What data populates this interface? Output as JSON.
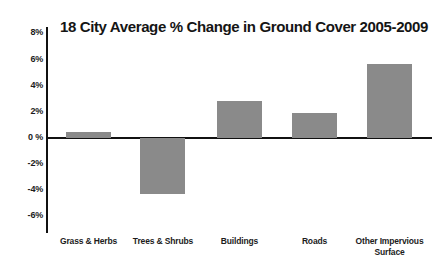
{
  "chart_data": {
    "type": "bar",
    "title": "18 City Average % Change in Ground Cover 2005-2009",
    "xlabel": "",
    "ylabel": "",
    "categories": [
      "Grass & Herbs",
      "Trees & Shrubs",
      "Buildings",
      "Roads",
      "Other Impervious Surface"
    ],
    "values": [
      0.45,
      -4.3,
      2.8,
      1.9,
      5.7
    ],
    "ylim": [
      -6,
      8
    ],
    "ytick_labels": [
      "8%",
      "6%",
      "4%",
      "2%",
      "0 %",
      "-2%",
      "-4%",
      "-6%"
    ],
    "ytick_values": [
      8,
      6,
      4,
      2,
      0,
      -2,
      -4,
      -6
    ],
    "grid": false,
    "legend": false,
    "bar_color": "#8a8a8a",
    "axis_color": "#111111",
    "text_color": "#1c1c1c",
    "background": "#ffffff"
  },
  "categories_wrapped": [
    {
      "line1": "Grass & Herbs",
      "line2": ""
    },
    {
      "line1": "Trees & Shrubs",
      "line2": ""
    },
    {
      "line1": "Buildings",
      "line2": ""
    },
    {
      "line1": "Roads",
      "line2": ""
    },
    {
      "line1": "Other Impervious",
      "line2": "Surface"
    }
  ]
}
